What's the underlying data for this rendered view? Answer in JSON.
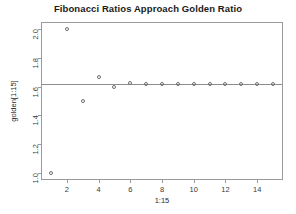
{
  "chart_data": {
    "type": "scatter",
    "title": "Fibonacci Ratios Approach Golden Ratio",
    "xlabel": "1:15",
    "ylabel": "golden[1:15]",
    "xlim": [
      0.44,
      15.56
    ],
    "ylim": [
      0.96,
      2.04
    ],
    "grid": false,
    "legend": null,
    "marker": "open-circle",
    "x": [
      1,
      2,
      3,
      4,
      5,
      6,
      7,
      8,
      9,
      10,
      11,
      12,
      13,
      14,
      15
    ],
    "values": [
      1.0,
      2.0,
      1.5,
      1.666667,
      1.6,
      1.625,
      1.615385,
      1.619048,
      1.617647,
      1.618182,
      1.617978,
      1.618056,
      1.618026,
      1.618037,
      1.618033
    ],
    "series": [
      {
        "name": "golden[1:15]",
        "values": [
          1.0,
          2.0,
          1.5,
          1.666667,
          1.6,
          1.625,
          1.615385,
          1.619048,
          1.617647,
          1.618182,
          1.617978,
          1.618056,
          1.618026,
          1.618037,
          1.618033
        ]
      }
    ],
    "reference_lines": [
      {
        "name": "golden-ratio",
        "orientation": "horizontal",
        "y": 1.618034,
        "color": "#8d8d8d"
      }
    ],
    "y_ticks": [
      1.0,
      1.2,
      1.4,
      1.6,
      1.8,
      2.0
    ],
    "y_tick_labels": [
      "1.0",
      "1.2",
      "1.4",
      "1.6",
      "1.8",
      "2.0"
    ],
    "x_ticks": [
      2,
      4,
      6,
      8,
      10,
      12,
      14
    ],
    "x_tick_labels": [
      "2",
      "4",
      "6",
      "8",
      "10",
      "12",
      "14"
    ],
    "colors": {
      "background": "#ffffff",
      "axis": "#9a9a9a",
      "marker": "#6e6e6e",
      "reference_line": "#8d8d8d",
      "text": "#1a1a1a"
    }
  }
}
